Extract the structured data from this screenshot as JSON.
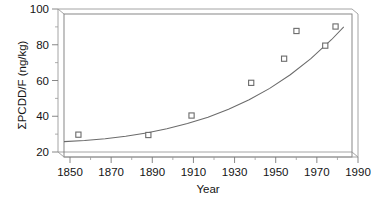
{
  "chart_data": {
    "type": "scatter",
    "title": "",
    "subtitle": "",
    "xlabel": "Year",
    "ylabel": "ΣPCDD/F (ng/kg)",
    "xlim": [
      1850,
      1990
    ],
    "ylim": [
      20,
      100
    ],
    "grid": false,
    "legend": null,
    "legend_position": "none",
    "x_major_ticks": [
      1850,
      1870,
      1890,
      1910,
      1930,
      1950,
      1970,
      1990
    ],
    "x_tick_labels": [
      "1850",
      "1870",
      "1890",
      "1910",
      "1930",
      "1950",
      "1970",
      "1990"
    ],
    "x_minor_ticks": [
      1860,
      1880,
      1900,
      1920,
      1940,
      1960,
      1980
    ],
    "y_major_ticks": [
      20,
      40,
      60,
      80,
      100
    ],
    "y_tick_labels": [
      "20",
      "40",
      "60",
      "80",
      "100"
    ],
    "y_minor_ticks": [
      30,
      50,
      70,
      90
    ],
    "marker": "open-square",
    "series": [
      {
        "name": "ΣPCDD/F measurements",
        "marker": "open-square",
        "x": [
          1857,
          1891,
          1912,
          1941,
          1957,
          1963,
          1977,
          1982
        ],
        "y": [
          32.5,
          32.3,
          43.2,
          61.5,
          75.0,
          90.5,
          82.3,
          93.0
        ],
        "points": [
          {
            "x": 1857,
            "y": 32.5
          },
          {
            "x": 1891,
            "y": 32.3
          },
          {
            "x": 1912,
            "y": 43.2
          },
          {
            "x": 1941,
            "y": 61.5
          },
          {
            "x": 1957,
            "y": 75.0
          },
          {
            "x": 1963,
            "y": 90.5
          },
          {
            "x": 1977,
            "y": 82.3
          },
          {
            "x": 1982,
            "y": 93.0
          }
        ]
      }
    ],
    "fit_curve": {
      "name": "exponential fit",
      "x": [
        1850,
        1860,
        1870,
        1880,
        1890,
        1900,
        1910,
        1920,
        1930,
        1940,
        1950,
        1960,
        1970,
        1980,
        1986
      ],
      "y": [
        28.6,
        29.2,
        30.2,
        31.6,
        33.4,
        35.8,
        38.7,
        42.3,
        46.7,
        52.0,
        58.4,
        66.0,
        75.0,
        85.6,
        92.8
      ]
    },
    "colors": {
      "axis": "#6e6e6e",
      "marker_edge": "#6b6b6b",
      "marker_face": "#ffffff",
      "curve": "#6b6b6b",
      "text": "#141414",
      "background": "#ffffff"
    }
  }
}
